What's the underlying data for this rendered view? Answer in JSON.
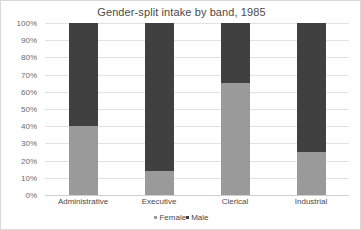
{
  "chart_data": {
    "type": "bar",
    "subtype": "stacked-percent-column",
    "title": "Gender-split intake by band, 1985",
    "xlabel": "",
    "ylabel": "",
    "categories": [
      "Administrative",
      "Executive",
      "Clerical",
      "Industrial"
    ],
    "series": [
      {
        "name": "Female",
        "color": "#9a9a9a",
        "values": [
          40,
          14,
          65,
          25
        ]
      },
      {
        "name": "Male",
        "color": "#404040",
        "values": [
          60,
          86,
          35,
          75
        ]
      }
    ],
    "ylim": [
      0,
      100
    ],
    "ytick_values": [
      0,
      10,
      20,
      30,
      40,
      50,
      60,
      70,
      80,
      90,
      100
    ],
    "ytick_labels": [
      "0%",
      "10%",
      "20%",
      "30%",
      "40%",
      "50%",
      "60%",
      "70%",
      "80%",
      "90%",
      "100%"
    ],
    "grid": "horizontal",
    "legend_position": "bottom-center",
    "legend_entries": [
      "Female",
      "Male"
    ]
  },
  "colors": {
    "female": "#9a9a9a",
    "male": "#404040",
    "gridline": "#e2e2e2",
    "axis": "#cfcfcf",
    "title_text": "#4a4a4a",
    "tick_text": "#6b6b6b",
    "background": "#ffffff",
    "frame": "#d9d9d9"
  }
}
